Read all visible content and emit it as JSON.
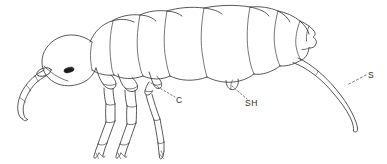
{
  "figure": {
    "kind": "scientific-line-drawing",
    "orientation": "facing left",
    "background_color": "#ffffff",
    "line_color": "#3b3b3b",
    "eye_color": "#1a1a1a",
    "label_color": "#2b2b2b"
  },
  "labels": [
    {
      "id": "c",
      "text": "C",
      "meaning": "coxa",
      "position": {
        "x": 176,
        "y": 96
      },
      "leader_style": "dotted",
      "points_to": {
        "x": 150,
        "y": 82
      }
    },
    {
      "id": "sh",
      "text": "SH",
      "meaning": "ventral tube / collophore",
      "position": {
        "x": 245,
        "y": 99
      },
      "leader_style": "dotted",
      "points_to": {
        "x": 233,
        "y": 85
      }
    },
    {
      "id": "s",
      "text": "S",
      "meaning": "furca / springing organ",
      "position": {
        "x": 368,
        "y": 71
      },
      "leader_style": "dotted",
      "points_to": {
        "x": 348,
        "y": 84
      }
    }
  ],
  "anatomy": {
    "head": "oval head at left with dark eye patch and segmented antenna curving down-left",
    "thorax": "three thoracic segments bearing three pairs of segmented legs with clawed tips",
    "abdomen": "large segmented abdomen with posterior notch",
    "appendages": [
      "antenna",
      "leg-pair-1",
      "leg-pair-2",
      "leg-pair-3",
      "ventral-tube",
      "furca"
    ]
  }
}
